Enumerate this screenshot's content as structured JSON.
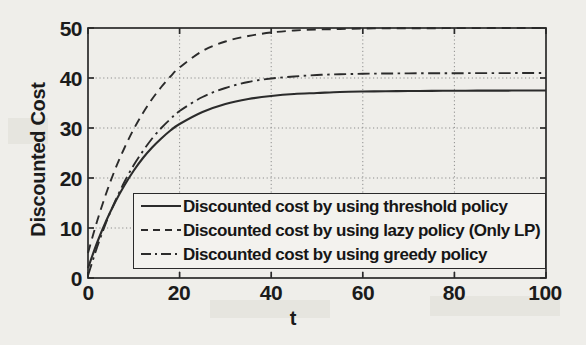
{
  "chart_data": {
    "type": "line",
    "title": "",
    "xlabel": "t",
    "ylabel": "Discounted Cost",
    "xlim": [
      0,
      100
    ],
    "ylim": [
      0,
      50
    ],
    "xticks": [
      0,
      20,
      40,
      60,
      80,
      100
    ],
    "yticks": [
      0,
      10,
      20,
      30,
      40,
      50
    ],
    "grid": true,
    "legend_position": "lower-left-inset",
    "x": [
      0,
      2,
      4,
      6,
      8,
      10,
      12,
      14,
      16,
      18,
      20,
      25,
      30,
      35,
      40,
      45,
      50,
      55,
      60,
      65,
      70,
      75,
      80,
      85,
      90,
      95,
      100
    ],
    "series": [
      {
        "name": "Discounted cost by using threshold policy",
        "style": "solid",
        "color": "#2b2b2b",
        "asymptote": 37.5,
        "values": [
          2.0,
          7.1,
          11.5,
          15.3,
          18.6,
          21.5,
          24.0,
          26.1,
          27.9,
          29.5,
          30.8,
          33.2,
          34.8,
          35.8,
          36.4,
          36.8,
          37.0,
          37.2,
          37.3,
          37.35,
          37.4,
          37.42,
          37.45,
          37.47,
          37.48,
          37.49,
          37.5
        ]
      },
      {
        "name": "Discounted cost by using lazy policy (Only LP)",
        "style": "dashed",
        "color": "#2b2b2b",
        "asymptote": 50.0,
        "values": [
          5.0,
          11.4,
          17.0,
          21.9,
          26.1,
          29.8,
          33.0,
          35.8,
          38.2,
          40.3,
          42.1,
          45.4,
          47.3,
          48.4,
          49.1,
          49.5,
          49.7,
          49.8,
          49.9,
          49.93,
          49.95,
          49.96,
          49.97,
          49.98,
          49.99,
          49.99,
          50.0
        ]
      },
      {
        "name": "Discounted cost by using greedy policy",
        "style": "dashdot",
        "color": "#2b2b2b",
        "asymptote": 41.0,
        "values": [
          0.5,
          6.2,
          11.2,
          15.5,
          19.3,
          22.6,
          25.4,
          27.9,
          30.0,
          31.8,
          33.4,
          36.2,
          38.0,
          39.2,
          39.9,
          40.3,
          40.6,
          40.75,
          40.85,
          40.9,
          40.93,
          40.95,
          40.96,
          40.97,
          40.98,
          40.99,
          41.0
        ]
      }
    ]
  },
  "axis": {
    "y_tick_labels": [
      "0",
      "10",
      "20",
      "30",
      "40",
      "50"
    ],
    "x_tick_labels": [
      "0",
      "20",
      "40",
      "60",
      "80",
      "100"
    ],
    "y_axis_label": "Discounted Cost",
    "x_axis_label": "t"
  },
  "legend": {
    "entries": [
      {
        "label": "Discounted cost by using threshold policy",
        "style": "solid"
      },
      {
        "label": "Discounted cost by using lazy policy (Only LP)",
        "style": "dashed"
      },
      {
        "label": "Discounted cost by using greedy policy",
        "style": "dashdot"
      }
    ]
  },
  "colors": {
    "background": "#efeeea",
    "axis": "#2a2a2a",
    "grid": "#8d8d8d",
    "curve": "#2b2b2b",
    "text": "#1b1b1b"
  }
}
